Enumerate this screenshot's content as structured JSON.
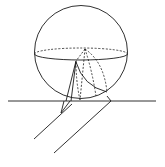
{
  "figure": {
    "width": 165,
    "height": 167,
    "background": "#ffffff",
    "stroke_color": "#1a1a1a",
    "elements": [
      {
        "id": "sphere",
        "type": "circle",
        "cx": 81,
        "cy": 52,
        "r": 47
      },
      {
        "id": "equator-front",
        "type": "half-ellipse",
        "style": "solid",
        "cx": 81,
        "cy": 54,
        "rx": 47,
        "ry": 6
      },
      {
        "id": "equator-back",
        "type": "half-ellipse",
        "style": "dashed",
        "cx": 81,
        "cy": 54,
        "rx": 47,
        "ry": 6
      },
      {
        "id": "ground-line",
        "type": "line",
        "x1": 8,
        "y1": 101,
        "x2": 156,
        "y2": 101
      },
      {
        "id": "cylinder-edge-left",
        "type": "line",
        "x1": 70,
        "y1": 104,
        "x2": 34,
        "y2": 139
      },
      {
        "id": "cylinder-edge-right",
        "type": "polyline",
        "points": "107,96 111,101 54,153"
      }
    ]
  }
}
